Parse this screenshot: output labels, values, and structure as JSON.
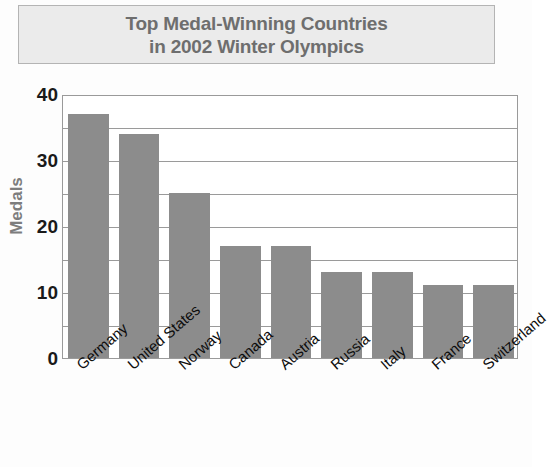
{
  "title": {
    "line1": "Top Medal-Winning Countries",
    "line2": "in 2002 Winter Olympics"
  },
  "axis": {
    "y_title": "Medals",
    "y_ticks": [
      "40",
      "30",
      "20",
      "10",
      "0"
    ]
  },
  "colors": {
    "bar": "#8c8c8c",
    "title_text": "#6e6e6e",
    "banner_fill": "#ebebeb",
    "banner_border": "#b4b4b4",
    "grid": "#9a9a9a",
    "axis_title": "#7d7d7d"
  },
  "chart_data": {
    "type": "bar",
    "title": "Top Medal-Winning Countries in 2002 Winter Olympics",
    "xlabel": "",
    "ylabel": "Medals",
    "ylim": [
      0,
      40
    ],
    "ytick_major_step": 10,
    "ygrid_minor_step": 5,
    "grid": true,
    "legend": "none",
    "categories": [
      "Germany",
      "United States",
      "Norway",
      "Canada",
      "Austria",
      "Russia",
      "Italy",
      "France",
      "Switzerland"
    ],
    "values": [
      37,
      34,
      25,
      17,
      17,
      13,
      13,
      11,
      11
    ]
  }
}
